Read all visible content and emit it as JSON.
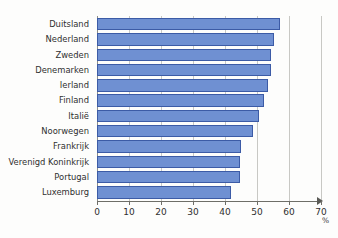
{
  "chart_data": {
    "type": "bar",
    "orientation": "horizontal",
    "title": "",
    "subtitle": "",
    "xlabel": "%",
    "ylabel": "",
    "xlim": [
      0,
      75
    ],
    "ylim": null,
    "grid": true,
    "gridlines": [
      0,
      10,
      20,
      30,
      40,
      50,
      60,
      70
    ],
    "legend": null,
    "legend_position": "none",
    "categories": [
      "Duitsland",
      "Nederland",
      "Zweden",
      "Denemarken",
      "Ierland",
      "Finland",
      "Italië",
      "Noorwegen",
      "Frankrijk",
      "Verenigd Koninkrijk",
      "Portugal",
      "Luxemburg"
    ],
    "values": [
      61,
      59,
      58,
      58,
      57,
      55.5,
      54,
      52,
      48,
      47.5,
      47.5,
      44.5
    ],
    "xticks": [
      0,
      10,
      20,
      30,
      40,
      50,
      60,
      70
    ],
    "xtick_labels": [
      "0",
      "10",
      "20",
      "30",
      "40",
      "50",
      "60",
      "70"
    ],
    "bar_color": "#6f90d2",
    "bar_border_color": "#3c5ba6",
    "axis_color": "#6e6e68",
    "grid_color": "#c8c8c4",
    "background_color": "#fdfdfc"
  },
  "axis": {
    "unit_label": "%"
  }
}
